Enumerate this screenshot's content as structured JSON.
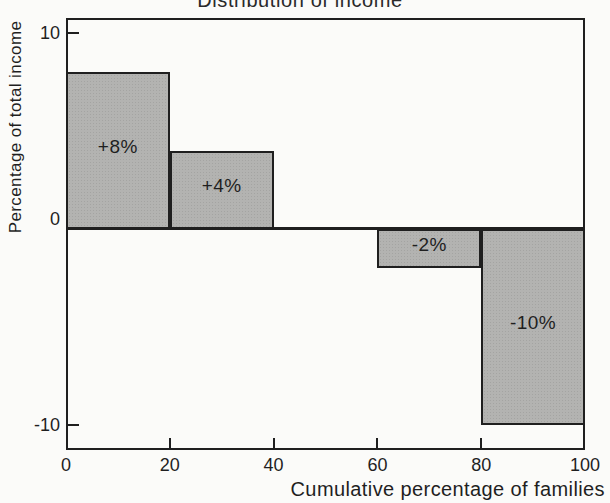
{
  "chart_data": {
    "type": "bar",
    "title": "Distribution of income",
    "xlabel": "Cumulative percentage of families",
    "ylabel": "Percentage of total income",
    "xlim": [
      0,
      100
    ],
    "ylim": [
      -10,
      10
    ],
    "x_ticks": [
      0,
      20,
      40,
      60,
      80,
      100
    ],
    "y_ticks": [
      10,
      0,
      -10
    ],
    "grid": false,
    "legend": false,
    "bars": [
      {
        "x_start": 0,
        "x_end": 20,
        "value": 8,
        "label": "+8%"
      },
      {
        "x_start": 20,
        "x_end": 40,
        "value": 4,
        "label": "+4%"
      },
      {
        "x_start": 40,
        "x_end": 60,
        "value": 0,
        "label": ""
      },
      {
        "x_start": 60,
        "x_end": 80,
        "value": -2,
        "label": "-2%"
      },
      {
        "x_start": 80,
        "x_end": 100,
        "value": -10,
        "label": "-10%"
      }
    ]
  },
  "colors": {
    "background": "#fbfbf9",
    "bar_fill": "#b3b3b1",
    "bar_halftone_dot": "#a4a4a2",
    "line": "#1f1f1f",
    "text": "#1f1f1f"
  }
}
